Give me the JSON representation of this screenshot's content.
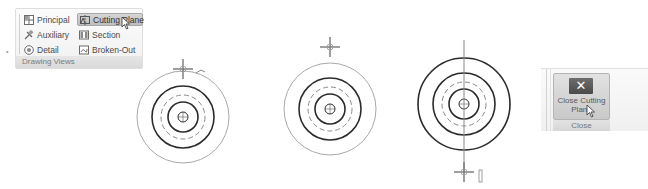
{
  "ribbon_group": {
    "caption": "Drawing Views",
    "buttons": [
      {
        "label": "Principal",
        "icon": "principal-view-icon",
        "active": false
      },
      {
        "label": "Cutting Plane",
        "icon": "cutting-plane-icon",
        "active": true
      },
      {
        "label": "Auxiliary",
        "icon": "auxiliary-view-icon",
        "active": false
      },
      {
        "label": "Section",
        "icon": "section-view-icon",
        "active": false
      },
      {
        "label": "Detail",
        "icon": "detail-view-icon",
        "active": false
      },
      {
        "label": "Broken-Out",
        "icon": "broken-out-view-icon",
        "active": false
      }
    ]
  },
  "drawing": {
    "views": [
      {
        "name": "step-1-place-point",
        "cx": 183,
        "cy": 117
      },
      {
        "name": "step-2-placed-point",
        "cx": 330,
        "cy": 109
      },
      {
        "name": "step-3-cutting-line",
        "cx": 464,
        "cy": 104
      }
    ]
  },
  "close_panel": {
    "button_label_line1": "Close Cutting",
    "button_label_line2": "Plane",
    "caption": "Close",
    "icon": "close-icon",
    "icon_glyph": "✕"
  },
  "colors": {
    "dark_line": "#2b2b2b",
    "light_line": "#a9a9a9",
    "dashed_line": "#8a8a8a",
    "active_button": "#c8c8c8"
  }
}
